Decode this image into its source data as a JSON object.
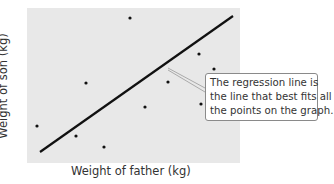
{
  "chart_data": {
    "type": "scatter",
    "title": "",
    "xlabel": "Weight of father (kg)",
    "ylabel": "Weight of son (kg)",
    "grid": false,
    "points": [
      {
        "x": 37,
        "y": 126
      },
      {
        "x": 76,
        "y": 136
      },
      {
        "x": 104,
        "y": 147
      },
      {
        "x": 86,
        "y": 83
      },
      {
        "x": 130,
        "y": 18
      },
      {
        "x": 145,
        "y": 107
      },
      {
        "x": 168,
        "y": 82
      },
      {
        "x": 199,
        "y": 54
      },
      {
        "x": 214,
        "y": 69
      },
      {
        "x": 201,
        "y": 104
      }
    ],
    "regression_line": {
      "x1": 40,
      "y1": 152,
      "x2": 233,
      "y2": 16
    },
    "annotation": "The regression line is the line that best fits all the points on the graph.",
    "plot_area": {
      "left": 27,
      "top": 8,
      "right": 240,
      "bottom": 163,
      "background": "#e8e8e8"
    }
  },
  "labels": {
    "x": "Weight of father (kg)",
    "y": "Weight of son (kg)"
  },
  "callout": {
    "lines": [
      "The regression line is",
      "the line that best fits all",
      "the points on the graph."
    ]
  }
}
